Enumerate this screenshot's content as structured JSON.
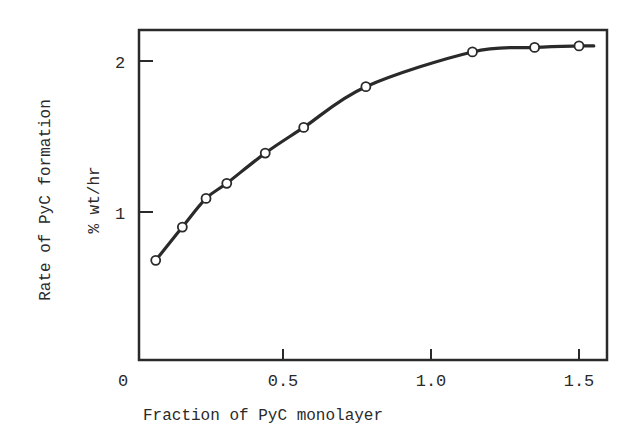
{
  "chart_data": {
    "type": "line",
    "title": "",
    "xlabel": "Fraction of PyC monolayer",
    "ylabel": "Rate of PyC formation",
    "ylabel_units": "% wt/hr",
    "xlim": [
      0,
      1.58
    ],
    "ylim": [
      0,
      2.2
    ],
    "grid": false,
    "legend": null,
    "x_ticks": [
      0.5,
      1.0,
      1.5
    ],
    "x_tick_labels": [
      "0",
      "0.5",
      "1.0",
      "1.5"
    ],
    "y_ticks": [
      1,
      2
    ],
    "y_tick_labels": [
      "1",
      "2"
    ],
    "series": [
      {
        "name": "Rate of PyC formation",
        "marker": "open-circle",
        "line": "smooth fitted curve",
        "x": [
          0.07,
          0.16,
          0.24,
          0.31,
          0.44,
          0.57,
          0.78,
          1.14,
          1.35,
          1.5
        ],
        "y": [
          0.68,
          0.9,
          1.09,
          1.19,
          1.39,
          1.56,
          1.83,
          2.06,
          2.09,
          2.1
        ]
      }
    ]
  },
  "axes": {
    "origin_label": "0",
    "x_tick_labels": [
      "0.5",
      "1.0",
      "1.5"
    ],
    "y_tick_labels": [
      "1",
      "2"
    ],
    "xlabel": "Fraction of PyC monolayer",
    "ylabel": "Rate of PyC formation",
    "ylabel_units": "% wt/hr"
  },
  "colors": {
    "ink": "#2a2a2a",
    "background": "#ffffff"
  }
}
